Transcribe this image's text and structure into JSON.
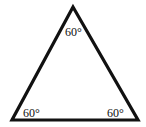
{
  "diagram": {
    "shape": "equilateral-triangle",
    "stroke_color": "#111111",
    "vertices": {
      "apex": {
        "x": 73,
        "y": 7
      },
      "bottom_left": {
        "x": 12,
        "y": 120
      },
      "bottom_right": {
        "x": 138,
        "y": 120
      }
    },
    "angles": {
      "top": "60°",
      "bottom_left": "60°",
      "bottom_right": "60°"
    }
  }
}
